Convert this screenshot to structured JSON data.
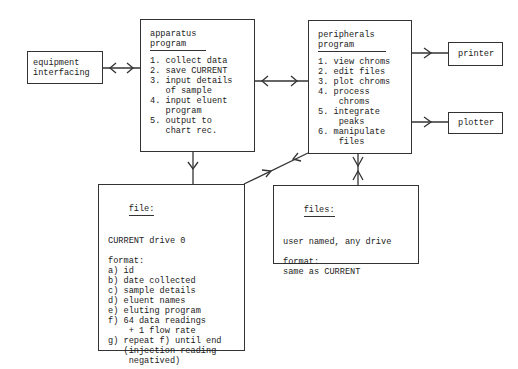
{
  "equipment": {
    "lines": [
      "equipment",
      "interfacing"
    ]
  },
  "apparatus": {
    "title_lines": [
      "apparatus",
      "program"
    ],
    "items": [
      "1. collect data",
      "2. save CURRENT",
      "3. input details",
      "   of sample",
      "4. input eluent",
      "   program",
      "5. output to",
      "   chart rec."
    ]
  },
  "peripherals": {
    "title_lines": [
      "peripherals",
      "program"
    ],
    "items": [
      "1. view chroms",
      "2. edit files",
      "3. plot chroms",
      "4. process",
      "    chroms",
      "5. integrate",
      "    peaks",
      "6. manipulate",
      "    files"
    ]
  },
  "printer": {
    "label": "printer"
  },
  "plotter": {
    "label": "plotter"
  },
  "file": {
    "title": "file:",
    "location": "CURRENT drive 0",
    "format_label": "format:",
    "items": [
      "a) id",
      "b) date collected",
      "c) sample details",
      "d) eluent names",
      "e) eluting program",
      "f) 64 data readings",
      "    + 1 flow rate",
      "g) repeat f) until end",
      "   (injection reading",
      "    negatived)"
    ]
  },
  "files": {
    "title": "files:",
    "location": "user named, any drive",
    "format_label": "format:",
    "format_value": "same as CURRENT"
  }
}
